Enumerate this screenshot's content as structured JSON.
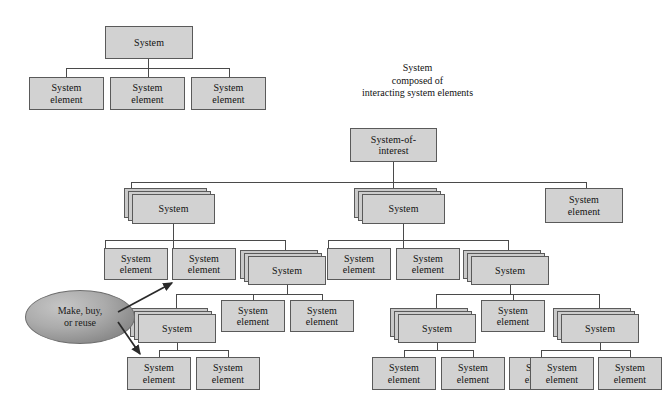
{
  "diagram": {
    "title_caption": "System\ncomposed of\ninteracting system elements",
    "labels": {
      "system": "System",
      "system_element": "System\nelement",
      "system_of_interest": "System-of-\ninterest",
      "make_buy_reuse": "Make, buy,\nor reuse"
    },
    "colors": {
      "box_fill": "#d2d2d2",
      "box_fill_back": "#c9c9c9",
      "box_border": "#5a5a5a",
      "line": "#4a4a4a",
      "ellipse_fill": "#ababab",
      "text": "#111111",
      "background": "#ffffff"
    },
    "upper_example": {
      "root": {
        "label": "System",
        "x": 105,
        "y": 26,
        "w": 88,
        "h": 33
      },
      "children": [
        {
          "label": "System\nelement",
          "x": 29,
          "y": 77,
          "w": 75,
          "h": 33
        },
        {
          "label": "System\nelement",
          "x": 110,
          "y": 77,
          "w": 75,
          "h": 33
        },
        {
          "label": "System\nelement",
          "x": 191,
          "y": 77,
          "w": 75,
          "h": 33
        }
      ]
    },
    "main_tree": {
      "root": {
        "label": "System-of-\ninterest",
        "x": 350,
        "y": 128,
        "w": 87,
        "h": 34
      },
      "level2": [
        {
          "kind": "stack",
          "label": "System",
          "x": 130,
          "y": 190,
          "w": 83,
          "h": 30
        },
        {
          "kind": "stack",
          "label": "System",
          "x": 360,
          "y": 190,
          "w": 83,
          "h": 30
        },
        {
          "kind": "single",
          "label": "System\nelement",
          "x": 545,
          "y": 188,
          "w": 78,
          "h": 35
        }
      ],
      "left_branch": {
        "level3": [
          {
            "kind": "single",
            "label": "System\nelement",
            "x": 104,
            "y": 248,
            "w": 64,
            "h": 32
          },
          {
            "kind": "single",
            "label": "System\nelement",
            "x": 172,
            "y": 248,
            "w": 64,
            "h": 32
          },
          {
            "kind": "stack",
            "label": "System",
            "x": 245,
            "y": 255,
            "w": 78,
            "h": 30
          }
        ],
        "level4": [
          {
            "kind": "stack",
            "label": "System",
            "x": 135,
            "y": 313,
            "w": 78,
            "h": 30
          },
          {
            "kind": "single",
            "label": "System\nelement",
            "x": 221,
            "y": 300,
            "w": 64,
            "h": 32
          },
          {
            "kind": "single",
            "label": "System\nelement",
            "x": 290,
            "y": 300,
            "w": 64,
            "h": 32
          }
        ],
        "level5": [
          {
            "kind": "single",
            "label": "System\nelement",
            "x": 127,
            "y": 357,
            "w": 64,
            "h": 33
          },
          {
            "kind": "single",
            "label": "System\nelement",
            "x": 196,
            "y": 357,
            "w": 64,
            "h": 33
          }
        ]
      },
      "right_branch": {
        "level3": [
          {
            "kind": "single",
            "label": "System\nelement",
            "x": 327,
            "y": 248,
            "w": 64,
            "h": 32
          },
          {
            "kind": "single",
            "label": "System\nelement",
            "x": 396,
            "y": 248,
            "w": 64,
            "h": 32
          },
          {
            "kind": "stack",
            "label": "System",
            "x": 468,
            "y": 255,
            "w": 78,
            "h": 30
          }
        ],
        "level4": [
          {
            "kind": "stack",
            "label": "System",
            "x": 395,
            "y": 313,
            "w": 78,
            "h": 30
          },
          {
            "kind": "single",
            "label": "System\nelement",
            "x": 481,
            "y": 300,
            "w": 64,
            "h": 32
          },
          {
            "kind": "stack",
            "label": "System",
            "x": 560,
            "y": 313,
            "w": 78,
            "h": 30
          }
        ],
        "level5": [
          {
            "kind": "single",
            "label": "System\nelement",
            "x": 372,
            "y": 357,
            "w": 64,
            "h": 33
          },
          {
            "kind": "single",
            "label": "System\nelement",
            "x": 441,
            "y": 357,
            "w": 64,
            "h": 33
          },
          {
            "kind": "single",
            "label": "System\nelement",
            "x": 509,
            "y": 357,
            "w": 64,
            "h": 33
          },
          {
            "kind": "single",
            "label": "System\nelement",
            "x": 530,
            "y": 357,
            "w": 64,
            "h": 33
          },
          {
            "kind": "single",
            "label": "System\nelement",
            "x": 598,
            "y": 357,
            "w": 64,
            "h": 33
          }
        ]
      }
    },
    "callout": {
      "label": "Make, buy,\nor reuse",
      "x": 25,
      "y": 290,
      "w": 108,
      "h": 52
    }
  }
}
